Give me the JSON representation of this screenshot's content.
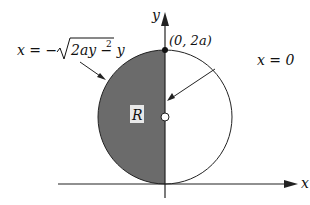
{
  "diagram": {
    "axes": {
      "x_label": "x",
      "y_label": "y"
    },
    "region_label": "R",
    "point_label": "(0, 2a)",
    "curve_label_left": "x = −√ 2ay − y²",
    "curve_label_left_parts": {
      "lhs": "x = −",
      "radicand": "2ay − y",
      "exp": "2"
    },
    "line_label_right": "x = 0",
    "colors": {
      "shaded": "#6b6b6b",
      "line": "#222222",
      "background": "#ffffff"
    }
  }
}
